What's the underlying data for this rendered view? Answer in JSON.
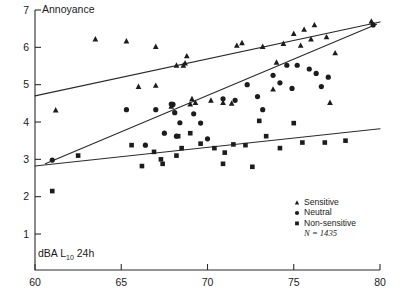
{
  "chart_data": {
    "type": "scatter",
    "title": "",
    "ylabel": "Annoyance",
    "xlabel": "dBA L10 24h",
    "xlabel_main": "dBA L",
    "xlabel_sub": "10",
    "xlabel_tail": " 24h",
    "xlim": [
      60,
      80
    ],
    "ylim": [
      0,
      7
    ],
    "grid": false,
    "legend_position": "bottom-right",
    "xticks": [
      60,
      65,
      70,
      75,
      80
    ],
    "yticks": [
      1,
      2,
      3,
      4,
      5,
      6,
      7
    ],
    "legend": [
      {
        "label": "Sensitive",
        "marker": "triangle"
      },
      {
        "label": "Neutral",
        "marker": "circle"
      },
      {
        "label": "Non-sensitive",
        "marker": "square"
      }
    ],
    "sample_note": "N = 1435",
    "sample_note_symbol": "N",
    "sample_note_value": " = 1435",
    "series": [
      {
        "name": "Sensitive",
        "marker": "triangle",
        "points": [
          [
            61.2,
            4.32
          ],
          [
            63.5,
            6.22
          ],
          [
            65.3,
            6.17
          ],
          [
            67.0,
            6.02
          ],
          [
            67.0,
            4.98
          ],
          [
            68.8,
            5.77
          ],
          [
            68.2,
            5.52
          ],
          [
            68.6,
            5.52
          ],
          [
            68.7,
            5.58
          ],
          [
            69.1,
            4.62
          ],
          [
            69.3,
            4.52
          ],
          [
            69.0,
            4.48
          ],
          [
            70.2,
            4.58
          ],
          [
            70.9,
            4.52
          ],
          [
            71.4,
            4.5
          ],
          [
            67.9,
            4.42
          ],
          [
            72.0,
            6.12
          ],
          [
            73.2,
            6.02
          ],
          [
            74.0,
            5.6
          ],
          [
            74.4,
            6.1
          ],
          [
            75.0,
            6.37
          ],
          [
            75.4,
            6.05
          ],
          [
            75.6,
            6.48
          ],
          [
            76.2,
            6.6
          ],
          [
            76.0,
            6.22
          ],
          [
            76.9,
            6.28
          ],
          [
            77.4,
            5.85
          ],
          [
            77.1,
            4.52
          ],
          [
            79.5,
            6.7
          ],
          [
            66.0,
            4.95
          ],
          [
            71.7,
            6.05
          ],
          [
            73.8,
            4.88
          ]
        ]
      },
      {
        "name": "Neutral",
        "marker": "circle",
        "points": [
          [
            61.0,
            2.98
          ],
          [
            65.3,
            4.33
          ],
          [
            67.0,
            4.33
          ],
          [
            68.0,
            4.47
          ],
          [
            68.1,
            4.25
          ],
          [
            68.4,
            3.98
          ],
          [
            69.2,
            4.22
          ],
          [
            69.6,
            3.97
          ],
          [
            70.0,
            3.55
          ],
          [
            70.9,
            4.62
          ],
          [
            71.6,
            4.58
          ],
          [
            72.9,
            4.68
          ],
          [
            73.8,
            5.25
          ],
          [
            74.2,
            5.05
          ],
          [
            74.9,
            4.9
          ],
          [
            75.2,
            5.52
          ],
          [
            75.9,
            5.42
          ],
          [
            76.3,
            5.3
          ],
          [
            76.6,
            4.95
          ],
          [
            77.0,
            5.2
          ],
          [
            79.6,
            6.6
          ],
          [
            67.5,
            3.7
          ],
          [
            68.2,
            3.62
          ],
          [
            73.2,
            4.33
          ],
          [
            67.9,
            4.48
          ],
          [
            72.3,
            5.0
          ],
          [
            74.6,
            5.52
          ],
          [
            66.4,
            3.38
          ]
        ]
      },
      {
        "name": "Non-sensitive",
        "marker": "square",
        "points": [
          [
            61.0,
            2.15
          ],
          [
            62.5,
            3.1
          ],
          [
            67.3,
            3.0
          ],
          [
            68.2,
            3.1
          ],
          [
            65.6,
            3.38
          ],
          [
            66.9,
            3.2
          ],
          [
            67.4,
            2.88
          ],
          [
            68.5,
            3.3
          ],
          [
            69.6,
            3.42
          ],
          [
            70.4,
            3.3
          ],
          [
            71.0,
            3.18
          ],
          [
            71.5,
            3.4
          ],
          [
            72.2,
            3.38
          ],
          [
            73.4,
            3.62
          ],
          [
            74.2,
            3.3
          ],
          [
            75.0,
            3.97
          ],
          [
            75.5,
            3.45
          ],
          [
            76.8,
            3.45
          ],
          [
            70.9,
            2.88
          ],
          [
            72.6,
            2.8
          ],
          [
            68.3,
            3.62
          ],
          [
            66.2,
            2.82
          ],
          [
            69.0,
            3.7
          ],
          [
            73.0,
            4.03
          ],
          [
            78.0,
            3.5
          ]
        ]
      }
    ],
    "fit_lines": [
      {
        "name": "Sensitive fit",
        "x0": 60.0,
        "y0": 4.7,
        "x1": 80.0,
        "y1": 6.68
      },
      {
        "name": "Neutral fit",
        "x0": 60.6,
        "y0": 2.88,
        "x1": 79.8,
        "y1": 6.62
      },
      {
        "name": "Non-sensitive fit",
        "x0": 60.0,
        "y0": 2.82,
        "x1": 80.0,
        "y1": 3.82
      }
    ]
  }
}
